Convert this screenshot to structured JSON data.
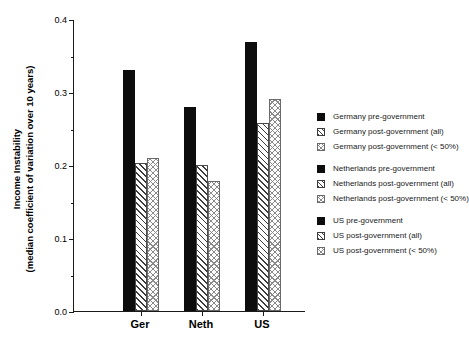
{
  "chart_data": {
    "type": "bar",
    "title": "",
    "xlabel": "",
    "ylabel": "Income Instability (median coefficient of variation over 10 years)",
    "ylabel_line1": "Income Instability",
    "ylabel_line2": "(median coefficient of variation over 10 years)",
    "categories": [
      "Ger",
      "Neth",
      "US"
    ],
    "ylim": [
      0.0,
      0.4
    ],
    "ytick_labels": [
      "0.0",
      "0.1",
      "0.2",
      "0.3",
      "0.4"
    ],
    "ytick_values": [
      0.0,
      0.1,
      0.2,
      0.3,
      0.4
    ],
    "yminor_values": [
      0.05,
      0.15,
      0.25,
      0.35
    ],
    "grid": false,
    "legend_position": "right",
    "series": [
      {
        "name": "pre-government",
        "pattern": "solid",
        "values": [
          0.33,
          0.28,
          0.368
        ]
      },
      {
        "name": "post-government (all)",
        "pattern": "diagonal-hatch",
        "values": [
          0.203,
          0.2,
          0.257
        ]
      },
      {
        "name": "post-government (< 50%)",
        "pattern": "cross-hatch",
        "values": [
          0.21,
          0.178,
          0.29
        ]
      }
    ],
    "bars": [
      {
        "group": "Ger",
        "label": "Germany pre-government",
        "value": 0.33,
        "pattern": "solid"
      },
      {
        "group": "Ger",
        "label": "Germany post-government (all)",
        "value": 0.203,
        "pattern": "diagonal-hatch"
      },
      {
        "group": "Ger",
        "label": "Germany post-government (< 50%)",
        "value": 0.21,
        "pattern": "cross-hatch"
      },
      {
        "group": "Neth",
        "label": "Netherlands pre-government",
        "value": 0.28,
        "pattern": "solid"
      },
      {
        "group": "Neth",
        "label": "Netherlands post-government (all)",
        "value": 0.2,
        "pattern": "diagonal-hatch"
      },
      {
        "group": "Neth",
        "label": "Netherlands post-government (< 50%)",
        "value": 0.178,
        "pattern": "cross-hatch"
      },
      {
        "group": "US",
        "label": "US pre-government",
        "value": 0.368,
        "pattern": "solid"
      },
      {
        "group": "US",
        "label": "US post-government (all)",
        "value": 0.257,
        "pattern": "diagonal-hatch"
      },
      {
        "group": "US",
        "label": "US post-government (< 50%)",
        "value": 0.29,
        "pattern": "cross-hatch"
      }
    ]
  },
  "legend": {
    "blocks": [
      {
        "entries": [
          {
            "pattern": "solid",
            "label": "Germany pre-government"
          },
          {
            "pattern": "diagonal-hatch",
            "label": "Germany post-government (all)"
          },
          {
            "pattern": "cross-hatch",
            "label": "Germany post-government (< 50%)"
          }
        ]
      },
      {
        "entries": [
          {
            "pattern": "solid",
            "label": "Netherlands pre-government"
          },
          {
            "pattern": "diagonal-hatch",
            "label": "Netherlands post-government (all)"
          },
          {
            "pattern": "cross-hatch",
            "label": "Netherlands post-government (< 50%)"
          }
        ]
      },
      {
        "entries": [
          {
            "pattern": "solid",
            "label": "US pre-government"
          },
          {
            "pattern": "diagonal-hatch",
            "label": "US post-government (all)"
          },
          {
            "pattern": "cross-hatch",
            "label": "US post-government (< 50%)"
          }
        ]
      }
    ]
  },
  "colors": {
    "axis": "#1a1a1a",
    "solid_fill": "#0d0d0d",
    "hatch_stroke": "#3c3c3c",
    "cross_stroke": "#8a8a8a",
    "background": "#ffffff"
  }
}
